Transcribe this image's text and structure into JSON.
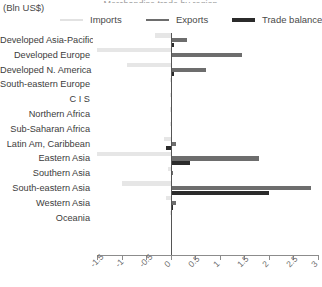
{
  "title_sliver": "Merchandise trade by region",
  "units_caption": "(Bln US$)",
  "legend": {
    "items": [
      {
        "label": "Imports",
        "color": "#e6e6e6",
        "key": "imports"
      },
      {
        "label": "Exports",
        "color": "#6d6d6d",
        "key": "exports"
      },
      {
        "label": "Trade balance",
        "color": "#2b2b2b",
        "key": "balance"
      }
    ]
  },
  "chart_data": {
    "type": "bar",
    "orientation": "horizontal",
    "title": "",
    "subtitle": "(Bln US$)",
    "xlabel": "",
    "ylabel": "",
    "xlim": [
      -1.5,
      3
    ],
    "xticks": [
      -1.5,
      -1,
      -0.5,
      0,
      0.5,
      1,
      1.5,
      2,
      2.5,
      3
    ],
    "xticklabels": [
      "-1.5",
      "-1",
      "-0.5",
      "0",
      "0.5",
      "1",
      "1.5",
      "2",
      "2.5",
      "3"
    ],
    "grid": false,
    "legend_position": "top",
    "categories": [
      "Developed Asia-Pacific",
      "Developed Europe",
      "Developed N. America",
      "South-eastern Europe",
      "C I S",
      "Northern Africa",
      "Sub-Saharan Africa",
      "Latin Am, Caribbean",
      "Eastern Asia",
      "Southern Asia",
      "South-eastern Asia",
      "Western Asia",
      "Oceania"
    ],
    "series": [
      {
        "name": "Imports",
        "color": "#e6e6e6",
        "values": [
          -0.32,
          -1.5,
          -0.88,
          -0.02,
          -0.02,
          -0.01,
          -0.02,
          -0.13,
          -1.5,
          -0.06,
          -1.0,
          -0.1,
          -0.01
        ]
      },
      {
        "name": "Exports",
        "color": "#6d6d6d",
        "values": [
          0.33,
          1.45,
          0.72,
          0.02,
          0.03,
          0.01,
          0.02,
          0.1,
          1.8,
          0.04,
          2.85,
          0.1,
          0.01
        ]
      },
      {
        "name": "Trade balance",
        "color": "#2b2b2b",
        "values": [
          0.06,
          0.03,
          0.06,
          0.01,
          0.02,
          0.01,
          0.01,
          -0.1,
          0.4,
          0.03,
          2.0,
          0.05,
          0.01
        ]
      }
    ]
  }
}
